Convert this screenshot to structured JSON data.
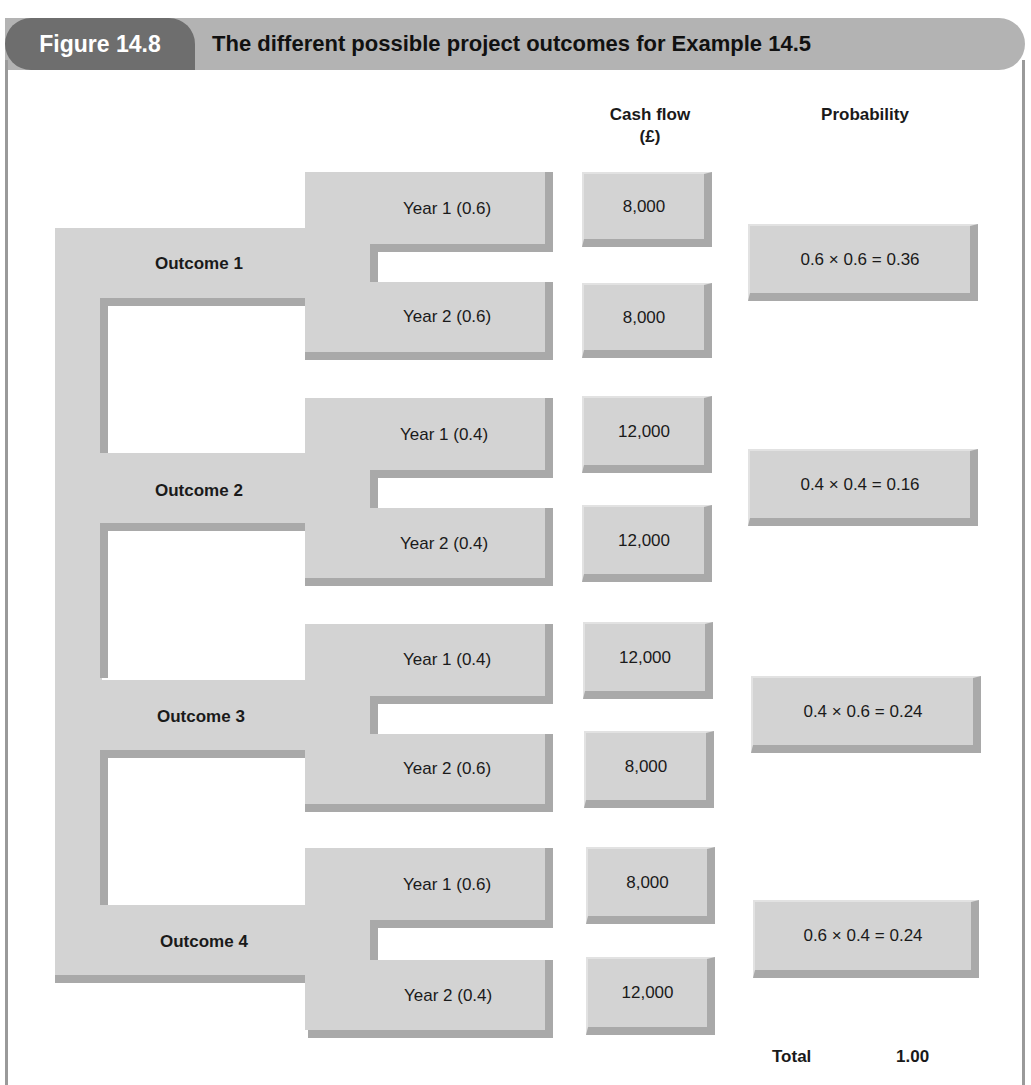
{
  "header": {
    "figure_label": "Figure 14.8",
    "title": "The different possible project outcomes for Example 14.5"
  },
  "columns": {
    "cash_flow": "Cash flow",
    "cash_flow_unit": "(£)",
    "probability": "Probability"
  },
  "outcomes": [
    {
      "label": "Outcome 1",
      "year1": {
        "label": "Year 1 (0.6)",
        "cash": "8,000"
      },
      "year2": {
        "label": "Year 2 (0.6)",
        "cash": "8,000"
      },
      "probability": "0.6 × 0.6 = 0.36"
    },
    {
      "label": "Outcome 2",
      "year1": {
        "label": "Year 1 (0.4)",
        "cash": "12,000"
      },
      "year2": {
        "label": "Year 2 (0.4)",
        "cash": "12,000"
      },
      "probability": "0.4 × 0.4 = 0.16"
    },
    {
      "label": "Outcome 3",
      "year1": {
        "label": "Year 1 (0.4)",
        "cash": "12,000"
      },
      "year2": {
        "label": "Year 2 (0.6)",
        "cash": "8,000"
      },
      "probability": "0.4 × 0.6 = 0.24"
    },
    {
      "label": "Outcome 4",
      "year1": {
        "label": "Year 1 (0.6)",
        "cash": "8,000"
      },
      "year2": {
        "label": "Year 2 (0.4)",
        "cash": "12,000"
      },
      "probability": "0.6 × 0.4 = 0.24"
    }
  ],
  "total": {
    "label": "Total",
    "value": "1.00"
  },
  "colors": {
    "pill": "#6e6e6e",
    "header_bar": "#b3b3b3",
    "block": "#d3d3d3",
    "shadow": "#a9a9a9"
  }
}
